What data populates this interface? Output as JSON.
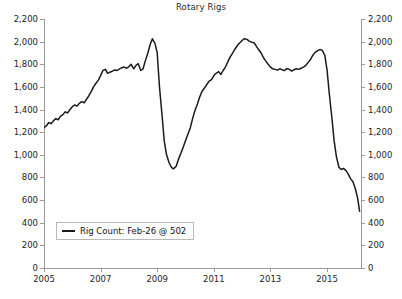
{
  "chart_data": {
    "type": "line",
    "title": "Rotary Rigs",
    "xlabel": "",
    "ylabel": "",
    "ylim": [
      0,
      2200
    ],
    "ytick_step": 200,
    "xlim": [
      2005.0,
      2016.2
    ],
    "grid": false,
    "legend_position": "bottom-left",
    "y_ticks": [
      "0",
      "200",
      "400",
      "600",
      "800",
      "1,000",
      "1,200",
      "1,400",
      "1,600",
      "1,800",
      "2,000",
      "2,200"
    ],
    "y_tick_values": [
      0,
      200,
      400,
      600,
      800,
      1000,
      1200,
      1400,
      1600,
      1800,
      2000,
      2200
    ],
    "x_ticks": [
      "2005",
      "2007",
      "2009",
      "2011",
      "2013",
      "2015"
    ],
    "x_tick_values": [
      2005,
      2007,
      2009,
      2011,
      2013,
      2015
    ],
    "axis_color": "#9a9a9a",
    "line_color": "#1a1a1a",
    "background": "#ffffff",
    "series": [
      {
        "name": "Rig Count",
        "legend_label": "Rig Count: Feb-26 @ 502",
        "last_point_label": "Feb-26",
        "last_point_value": 502,
        "x": [
          2005.0,
          2005.08,
          2005.17,
          2005.25,
          2005.33,
          2005.42,
          2005.5,
          2005.58,
          2005.67,
          2005.75,
          2005.83,
          2005.92,
          2006.0,
          2006.08,
          2006.17,
          2006.25,
          2006.33,
          2006.42,
          2006.5,
          2006.58,
          2006.67,
          2006.75,
          2006.83,
          2006.92,
          2007.0,
          2007.08,
          2007.17,
          2007.25,
          2007.33,
          2007.42,
          2007.5,
          2007.58,
          2007.67,
          2007.75,
          2007.83,
          2007.92,
          2008.0,
          2008.08,
          2008.17,
          2008.25,
          2008.33,
          2008.42,
          2008.5,
          2008.58,
          2008.67,
          2008.75,
          2008.83,
          2008.92,
          2009.0,
          2009.08,
          2009.17,
          2009.25,
          2009.33,
          2009.42,
          2009.5,
          2009.58,
          2009.67,
          2009.75,
          2009.83,
          2009.92,
          2010.0,
          2010.08,
          2010.17,
          2010.25,
          2010.33,
          2010.42,
          2010.5,
          2010.58,
          2010.67,
          2010.75,
          2010.83,
          2010.92,
          2011.0,
          2011.08,
          2011.17,
          2011.25,
          2011.33,
          2011.42,
          2011.5,
          2011.58,
          2011.67,
          2011.75,
          2011.83,
          2011.92,
          2012.0,
          2012.08,
          2012.17,
          2012.25,
          2012.33,
          2012.42,
          2012.5,
          2012.58,
          2012.67,
          2012.75,
          2012.83,
          2012.92,
          2013.0,
          2013.08,
          2013.17,
          2013.25,
          2013.33,
          2013.42,
          2013.5,
          2013.58,
          2013.67,
          2013.75,
          2013.83,
          2013.92,
          2014.0,
          2014.08,
          2014.17,
          2014.25,
          2014.33,
          2014.42,
          2014.5,
          2014.58,
          2014.67,
          2014.75,
          2014.83,
          2014.92,
          2015.0,
          2015.08,
          2015.17,
          2015.25,
          2015.33,
          2015.42,
          2015.5,
          2015.58,
          2015.67,
          2015.75,
          2015.83,
          2015.92,
          2016.0,
          2016.08,
          2016.15
        ],
        "values": [
          1240,
          1255,
          1285,
          1275,
          1300,
          1320,
          1310,
          1340,
          1355,
          1380,
          1370,
          1400,
          1425,
          1440,
          1430,
          1455,
          1470,
          1460,
          1490,
          1520,
          1560,
          1600,
          1630,
          1660,
          1700,
          1745,
          1755,
          1720,
          1730,
          1740,
          1750,
          1745,
          1760,
          1770,
          1775,
          1765,
          1780,
          1800,
          1760,
          1790,
          1805,
          1745,
          1760,
          1830,
          1900,
          1975,
          2025,
          1985,
          1900,
          1600,
          1350,
          1120,
          1000,
          930,
          890,
          876,
          900,
          960,
          1010,
          1070,
          1125,
          1180,
          1240,
          1320,
          1390,
          1450,
          1510,
          1560,
          1590,
          1620,
          1650,
          1665,
          1700,
          1720,
          1735,
          1710,
          1745,
          1780,
          1825,
          1865,
          1900,
          1935,
          1965,
          1990,
          2010,
          2026,
          2020,
          2005,
          1995,
          1990,
          1960,
          1930,
          1900,
          1860,
          1830,
          1800,
          1775,
          1760,
          1755,
          1748,
          1760,
          1750,
          1745,
          1762,
          1755,
          1740,
          1752,
          1760,
          1755,
          1765,
          1775,
          1790,
          1815,
          1845,
          1880,
          1905,
          1920,
          1930,
          1925,
          1880,
          1750,
          1540,
          1330,
          1125,
          985,
          890,
          870,
          880,
          860,
          830,
          790,
          760,
          700,
          620,
          502
        ]
      }
    ]
  },
  "legend": {
    "label": "Rig Count: Feb-26 @ 502"
  },
  "title": {
    "text": "Rotary Rigs"
  }
}
